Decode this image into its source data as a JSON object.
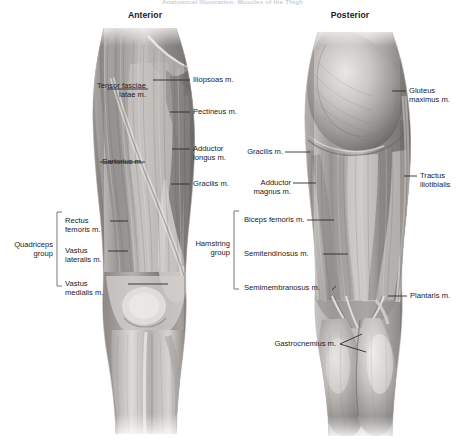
{
  "title": "Anatomical Illustration: Muscles of the Thigh",
  "headers": {
    "anterior": "Anterior",
    "posterior": "Posterior"
  },
  "colors": {
    "label_text": "#242021",
    "header_text": "#1a1a1a",
    "leader_line": "#2b2b2b",
    "bracket": "#6a6a6a",
    "title_text": "#cfcdd2",
    "background": "#ffffff",
    "muscle_light": "#e8e6e4",
    "muscle_mid": "#9a9896",
    "muscle_dark": "#4d4b4a"
  },
  "anterior": {
    "view": "Anterior",
    "labels_left": [
      {
        "id": "tensor-fasciae-latae",
        "lines": [
          "Tensor fasciae",
          "latae m."
        ]
      },
      {
        "id": "sartorius",
        "lines": [
          "Sartorius m."
        ]
      }
    ],
    "labels_right": [
      {
        "id": "iliopsoas",
        "lines": [
          "Iliopsoas m."
        ]
      },
      {
        "id": "pectineus",
        "lines": [
          "Pectineus m."
        ]
      },
      {
        "id": "adductor-longus",
        "lines": [
          "Adductor",
          "longus m."
        ]
      },
      {
        "id": "gracilis",
        "lines": [
          "Gracilis m."
        ]
      }
    ],
    "group": {
      "id": "quadriceps-group",
      "lines": [
        "Quadriceps",
        "group"
      ],
      "members": [
        {
          "id": "rectus-femoris",
          "lines": [
            "Rectus",
            "femoris m."
          ]
        },
        {
          "id": "vastus-lateralis",
          "lines": [
            "Vastus",
            "lateralis m."
          ]
        },
        {
          "id": "vastus-medialis",
          "lines": [
            "Vastus",
            "medialis m."
          ]
        }
      ]
    }
  },
  "posterior": {
    "view": "Posterior",
    "labels_left": [
      {
        "id": "gracilis-post",
        "lines": [
          "Gracilis m."
        ]
      },
      {
        "id": "adductor-magnus",
        "lines": [
          "Adductor",
          "magnus m."
        ]
      },
      {
        "id": "gastrocnemius",
        "lines": [
          "Gastrocnemius m."
        ]
      }
    ],
    "labels_right": [
      {
        "id": "gluteus-maximus",
        "lines": [
          "Gluteus",
          "maximus m."
        ]
      },
      {
        "id": "tractus-iliotibialis",
        "lines": [
          "Tractus",
          "iliotibialis"
        ]
      },
      {
        "id": "plantaris",
        "lines": [
          "Plantaris m."
        ]
      }
    ],
    "group": {
      "id": "hamstring-group",
      "lines": [
        "Hamstring",
        "group"
      ],
      "members": [
        {
          "id": "biceps-femoris",
          "lines": [
            "Biceps femoris m."
          ]
        },
        {
          "id": "semitendinosus",
          "lines": [
            "Semitendinosus m."
          ]
        },
        {
          "id": "semimembranosus",
          "lines": [
            "Semimembranosus m."
          ]
        }
      ]
    }
  }
}
